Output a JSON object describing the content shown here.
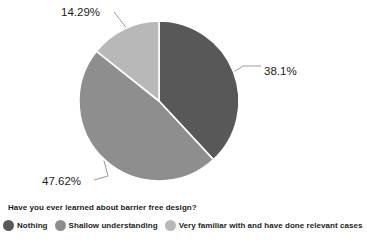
{
  "chart_data": {
    "type": "pie",
    "title": "",
    "question": "Have you ever learned about barrier free design?",
    "categories": [
      "Nothing",
      "Shallow understanding",
      "Very familiar with and have done relevant cases"
    ],
    "values": [
      38.1,
      47.62,
      14.29
    ],
    "labels": [
      "38.1%",
      "47.62%",
      "14.29%"
    ],
    "colors": [
      "#585858",
      "#8e8e8e",
      "#b8b8b8"
    ],
    "unit": "percent",
    "start_angle_deg": 0,
    "direction": "clockwise",
    "legend_position": "bottom",
    "grid": false,
    "slices": [
      {
        "category": "Nothing",
        "value": 38.1,
        "label": "38.1%",
        "color": "#585858"
      },
      {
        "category": "Shallow understanding",
        "value": 47.62,
        "label": "47.62%",
        "color": "#8e8e8e"
      },
      {
        "category": "Very familiar with and have done relevant cases",
        "value": 14.29,
        "label": "14.29%",
        "color": "#b8b8b8"
      }
    ]
  },
  "geometry": {
    "center_x": 159,
    "center_y": 101,
    "radius": 80
  },
  "annotations": {
    "label_right": {
      "text": "38.1%",
      "x": 264,
      "y": 75
    },
    "label_bottom_left": {
      "text": "47.62%",
      "x": 42,
      "y": 185
    },
    "label_top": {
      "text": "14.29%",
      "x": 61,
      "y": 16
    }
  },
  "legend": {
    "question": "Have you ever learned about barrier free design?",
    "items": [
      {
        "label": "Nothing",
        "color": "#585858"
      },
      {
        "label": "Shallow understanding",
        "color": "#8e8e8e"
      },
      {
        "label": "Very familiar with and have done relevant cases",
        "color": "#b8b8b8"
      }
    ]
  }
}
